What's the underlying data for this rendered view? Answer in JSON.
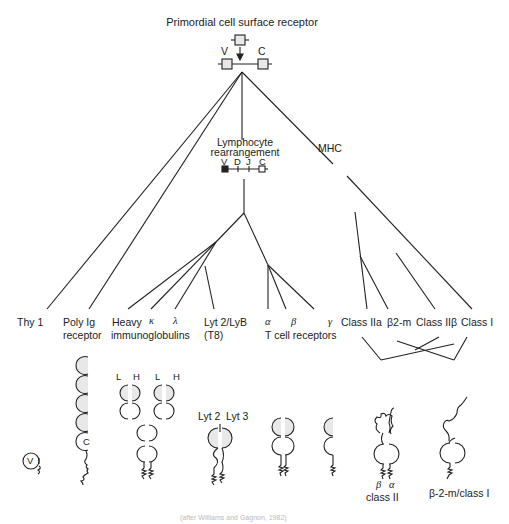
{
  "title": "Primordial cell surface receptor",
  "primordial": {
    "v_label": "V",
    "c_label": "C"
  },
  "lymphocyte": {
    "line1": "Lymphocyte",
    "line2": "rearrangement",
    "segments": [
      "V",
      "D",
      "J",
      "C"
    ]
  },
  "mhc_label": "MHC",
  "leaves": {
    "thy1": "Thy 1",
    "poly_ig_1": "Poly Ig",
    "poly_ig_2": "receptor",
    "heavy": "Heavy",
    "kappa": "κ",
    "lambda": "λ",
    "immunoglobulins": "immunoglobulins",
    "lyt2_1": "Lyt 2/LyB",
    "lyt2_2": "(T8)",
    "tcr_alpha": "α",
    "tcr_beta": "β",
    "tcr_gamma": "γ",
    "tcr_label": "T cell receptors",
    "class_iia": "Class IIa",
    "b2m": "β2-m",
    "class_iib": "Class IIβ",
    "class_i": "Class I"
  },
  "structures": {
    "thy1_domain": "V",
    "poly_ig_domain": "C",
    "ig_chain_labels": [
      "L",
      "H",
      "L",
      "H"
    ],
    "lyt_labels": {
      "lyt2": "Lyt 2",
      "lyt3": "Lyt 3"
    },
    "class2_chains": {
      "beta": "β",
      "alpha": "α"
    },
    "class2_label": "class II",
    "class1_label": "β-2-m/class I"
  },
  "caption": "(after Williams and Gagnon, 1982)",
  "colors": {
    "line": "#222222",
    "domain_fill": "#e8e8e8",
    "background": "#ffffff"
  }
}
